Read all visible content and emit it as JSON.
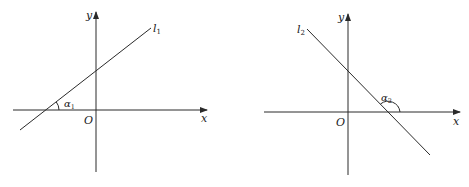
{
  "figures": [
    {
      "id": "left",
      "line_label": "l",
      "line_subscript": "1",
      "angle_label": "α",
      "angle_subscript": "1",
      "x_axis_label": "x",
      "y_axis_label": "y",
      "origin_label": "O",
      "slope": "positive"
    },
    {
      "id": "right",
      "line_label": "l",
      "line_subscript": "2",
      "angle_label": "α",
      "angle_subscript": "2",
      "x_axis_label": "x",
      "y_axis_label": "y",
      "origin_label": "O",
      "slope": "negative"
    }
  ],
  "colors": {
    "stroke": "#2a2a2a",
    "background": "#ffffff"
  }
}
